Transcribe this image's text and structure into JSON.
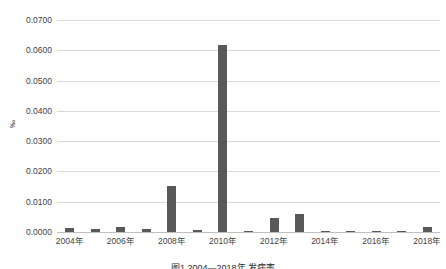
{
  "chart_data": {
    "type": "bar",
    "title": "",
    "subtitle": "",
    "xlabel": "",
    "ylabel": "‰",
    "ylim": [
      0.0,
      0.07
    ],
    "grid": true,
    "legend": false,
    "categories": [
      "2004年",
      "2005年",
      "2006年",
      "2007年",
      "2008年",
      "2009年",
      "2010年",
      "2011年",
      "2012年",
      "2013年",
      "2014年",
      "2015年",
      "2016年",
      "2017年",
      "2018年"
    ],
    "x_tick_labels": [
      "2004年",
      "2006年",
      "2008年",
      "2010年",
      "2012年",
      "2014年",
      "2016年",
      "2018年"
    ],
    "y_tick_labels": [
      "0.0700",
      "0.0600",
      "0.0500",
      "0.0400",
      "0.0300",
      "0.0200",
      "0.0100",
      "0.0000"
    ],
    "y_tick_values": [
      0.07,
      0.06,
      0.05,
      0.04,
      0.03,
      0.02,
      0.01,
      0.0
    ],
    "values": [
      0.0013,
      0.0009,
      0.0017,
      0.001,
      0.0152,
      0.0007,
      0.0617,
      0.0003,
      0.0045,
      0.0058,
      0.0004,
      0.0004,
      0.0004,
      0.0004,
      0.0018
    ],
    "bar_color": "#595959",
    "grid_color": "#d9d9d9",
    "axis_color": "#bfbfbf"
  },
  "caption": {
    "text": "图1 2004—2018年 发病率"
  }
}
